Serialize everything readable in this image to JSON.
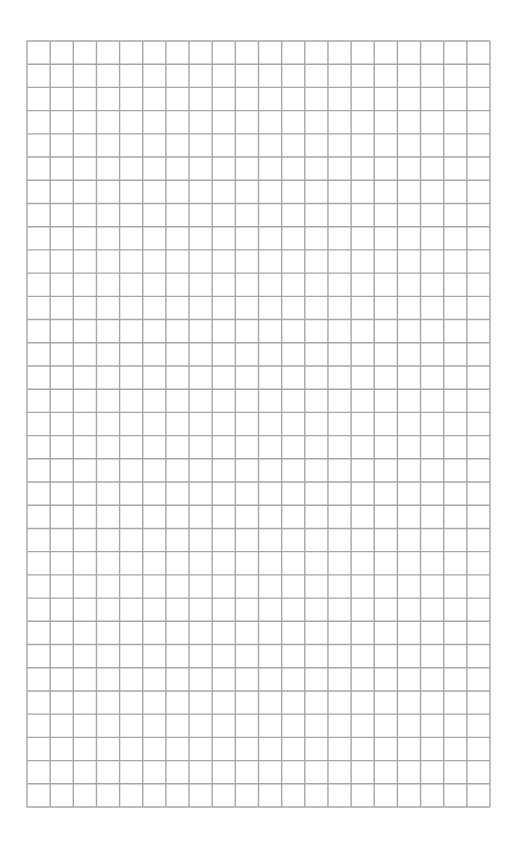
{
  "page": {
    "type": "graph-paper",
    "background": "#ffffff",
    "line_color": "#a6a6a6"
  },
  "grid": {
    "columns": 20,
    "rows": 33,
    "left": 26,
    "top": 40,
    "width": 463,
    "height": 766
  }
}
